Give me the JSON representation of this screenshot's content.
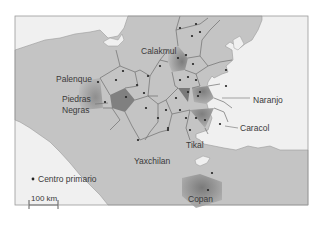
{
  "map": {
    "colors": {
      "land": "#c4c4c4",
      "sea": "#f0f0f0",
      "border": "#8a8a8a",
      "polygon_line": "#6e6e6e",
      "region_dark": "#7a7a7a",
      "dot": "#222222"
    },
    "labels": {
      "calakmul": "Calakmul",
      "palenque": "Palenque",
      "piedras_negras_1": "Piedras",
      "piedras_negras_2": "Negras",
      "naranjo": "Naranjo",
      "caracol": "Caracol",
      "tikal": "Tikal",
      "yaxchilan": "Yaxchilan",
      "copan": "Copan"
    },
    "legend": {
      "primary_center": "Centro primario"
    },
    "scale_bar": {
      "label": "100 km"
    }
  }
}
